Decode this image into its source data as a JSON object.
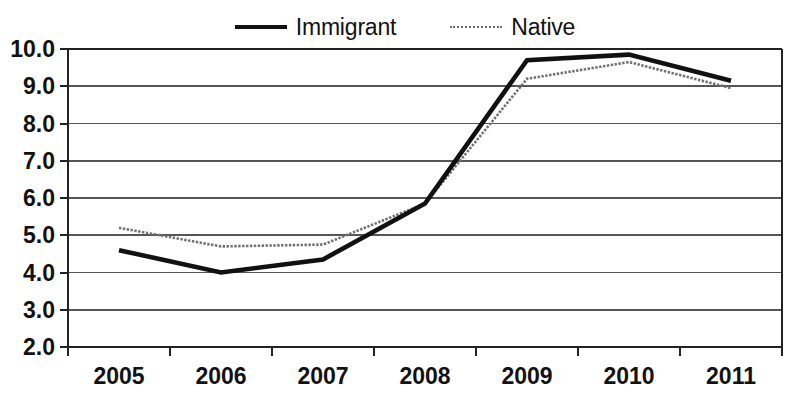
{
  "chart_data": {
    "type": "line",
    "title": "",
    "subtitle": "",
    "xlabel": "",
    "ylabel": "",
    "categories": [
      "2005",
      "2006",
      "2007",
      "2008",
      "2009",
      "2010",
      "2011"
    ],
    "series": [
      {
        "name": "Immigrant",
        "values": [
          4.6,
          4.0,
          4.35,
          5.85,
          9.7,
          9.85,
          9.15
        ],
        "color": "#111111",
        "style": "solid",
        "width": "thick"
      },
      {
        "name": "Native",
        "values": [
          5.2,
          4.7,
          4.75,
          5.85,
          9.2,
          9.65,
          8.95
        ],
        "color": "#707070",
        "style": "dotted",
        "width": "thin"
      }
    ],
    "ylim": [
      2.0,
      10.0
    ],
    "ytick_labels": [
      "10.0",
      "9.0",
      "8.0",
      "7.0",
      "6.0",
      "5.0",
      "4.0",
      "3.0",
      "2.0"
    ],
    "ytick_values": [
      10.0,
      9.0,
      8.0,
      7.0,
      6.0,
      5.0,
      4.0,
      3.0,
      2.0
    ],
    "xtick_labels": [
      "2005",
      "2006",
      "2007",
      "2008",
      "2009",
      "2010",
      "2011"
    ],
    "grid": true,
    "grid_axis": "y",
    "legend_position": "top-center",
    "legend_entries": [
      "Immigrant",
      "Native"
    ]
  },
  "legend": {
    "immigrant_label": "Immigrant",
    "native_label": "Native"
  }
}
